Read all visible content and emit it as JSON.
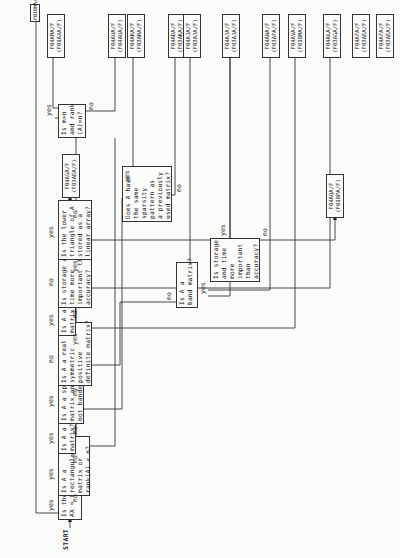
{
  "start_label": "START",
  "branch_labels": {
    "yes": "yes",
    "no": "no"
  },
  "decisions": [
    {
      "id": "d1",
      "text": "Is the problem\nAX = 0?"
    },
    {
      "id": "d2",
      "text": "Is A a\nrectangular\nmatrix or\nrank(A) < n?"
    },
    {
      "id": "d3",
      "text": "Is A a complex\nmatrix?"
    },
    {
      "id": "d4",
      "text": "Is A a sparse\nmatrix and\nnot banded?"
    },
    {
      "id": "d5",
      "text": "Is A a real\nsymmetric\npositive\ndefinite matrix?"
    },
    {
      "id": "d6",
      "text": "Is A a band\nmatrix?"
    },
    {
      "id": "d7",
      "text": "Is storage and\ntime more\nimportant than\naccuracy?"
    },
    {
      "id": "d8",
      "text": "Is the lower\ntriangle of A\nstored as a\nlinear array?"
    },
    {
      "id": "d9",
      "text": "Is A a\nband matrix?"
    },
    {
      "id": "d10",
      "text": "Is storage\nand time\nmore\nimportant\nthan\naccuracy?"
    },
    {
      "id": "d11",
      "text": "Does A have\nthe same\nsparsity\npattern as\na previously\nused matrix?"
    },
    {
      "id": "d12",
      "text": "Is m>n\nand rank\n(A)=n?"
    }
  ],
  "leaves": [
    {
      "id": "l1",
      "text": "F01BMA/F"
    },
    {
      "id": "l2",
      "text": "F04AMA/F\n(F01AXA/F)"
    },
    {
      "id": "l3",
      "text": "F04AUA/F\n(F04AUA/F)"
    },
    {
      "id": "l4",
      "text": "F04AKA/F\n(F03AHA/F)"
    },
    {
      "id": "l5",
      "text": "F04ADA/F\n(F03AKA/F)"
    },
    {
      "id": "l6",
      "text": "F04AJA/F\n(F03AJA/F)"
    },
    {
      "id": "l7",
      "text": "F04AJA/F\n(F03AJA/F)"
    },
    {
      "id": "l8",
      "text": "F04AWA/F\n(F03AFA/F)"
    },
    {
      "id": "l9",
      "text": "F04AVA/F\n(F01BMA/F)"
    },
    {
      "id": "l10",
      "text": "F04ALA/F\n(F03AGA/F)"
    },
    {
      "id": "l11",
      "text": "F04AFA/F\n(F03AEA/F)"
    },
    {
      "id": "l12",
      "text": "F04AQA/F\n(F01BPA/F)"
    },
    {
      "id": "l13",
      "text": "F04AGA/F\n(F03AEA/F)"
    },
    {
      "id": "l14",
      "text": "F04AFA/F\n(F03AEA/F)"
    }
  ]
}
